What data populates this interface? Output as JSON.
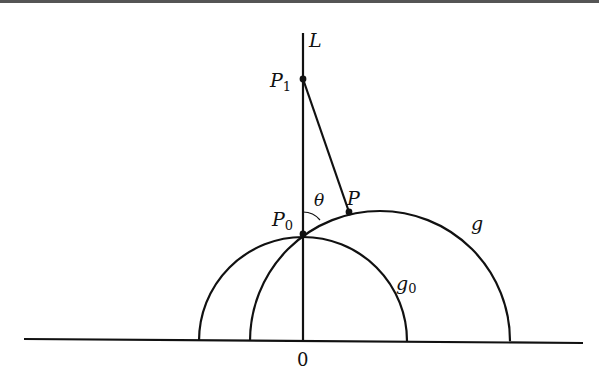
{
  "figure": {
    "type": "geometric-diagram"
  },
  "labels": {
    "line_L": "L",
    "point_P1": "P",
    "point_P1_sub": "1",
    "point_P0": "P",
    "point_P0_sub": "0",
    "point_P": "P",
    "angle": "θ",
    "curve_g": "g",
    "curve_g0": "g",
    "curve_g0_sub": "0",
    "origin": "0"
  },
  "geometry": {
    "baseline": {
      "x1": 24,
      "y1": 339,
      "x2": 583,
      "y2": 343
    },
    "axis_L": {
      "x": 303,
      "y_top": 33,
      "y_bottom": 341
    },
    "g0": {
      "cx": 303,
      "cy": 341,
      "r": 104
    },
    "g": {
      "cx": 380,
      "cy": 341,
      "r": 130
    },
    "P1": {
      "x": 303,
      "y": 79
    },
    "P0": {
      "x": 303,
      "y": 234
    },
    "P": {
      "x": 349,
      "y": 212
    }
  },
  "colors": {
    "stroke": "#111111",
    "top_rule": "#555555"
  }
}
